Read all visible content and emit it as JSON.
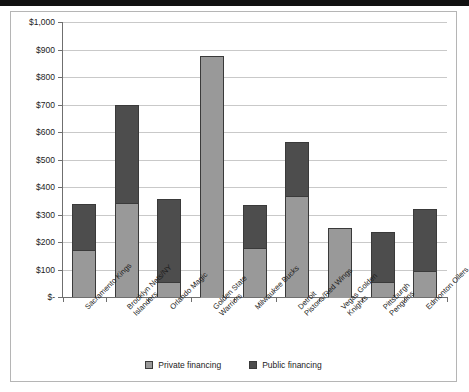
{
  "chart_data": {
    "type": "bar",
    "title": "",
    "subtitle": "",
    "xlabel": "",
    "ylabel": "",
    "stacked": true,
    "grid": true,
    "legend_position": "bottom",
    "ylim": [
      0,
      1000
    ],
    "ytick_values": [
      0,
      100,
      200,
      300,
      400,
      500,
      600,
      700,
      800,
      900,
      1000
    ],
    "ytick_labels": [
      "$-",
      "$100",
      "$200",
      "$300",
      "$400",
      "$500",
      "$600",
      "$700",
      "$800",
      "$900",
      "$1,000"
    ],
    "categories": [
      "Sacramento Kings",
      "Brooklyn Nets/NY Islanders",
      "Orlando Magic",
      "Golden State Warriors",
      "Milwaukee Bucks",
      "Detroit Pistons/Red Wings",
      "Vegas Golden Knights",
      "Pittsburgh Penguins",
      "Edmonton Oilers"
    ],
    "category_lines": [
      [
        "Sacramento Kings"
      ],
      [
        "Brooklyn Nets/NY",
        "Islanders"
      ],
      [
        "Orlando Magic"
      ],
      [
        "Golden State",
        "Warriors"
      ],
      [
        "Milwaukee Bucks"
      ],
      [
        "Detroit",
        "Pistons/Red Wings"
      ],
      [
        "Vegas Golden",
        "Knights"
      ],
      [
        "Pittsburgh",
        "Penguins"
      ],
      [
        "Edmonton Oilers"
      ]
    ],
    "series": [
      {
        "name": "Private financing",
        "color": "#999999",
        "values": [
          168,
          340,
          50,
          875,
          175,
          365,
          250,
          50,
          90
        ]
      },
      {
        "name": "Public financing",
        "color": "#4d4d4d",
        "values": [
          172,
          360,
          305,
          0,
          160,
          200,
          0,
          185,
          230
        ]
      }
    ],
    "totals": [
      340,
      700,
      355,
      875,
      335,
      565,
      250,
      235,
      320
    ]
  },
  "legend": {
    "items": [
      {
        "label": "Private financing",
        "color": "#999999"
      },
      {
        "label": "Public financing",
        "color": "#4d4d4d"
      }
    ]
  }
}
